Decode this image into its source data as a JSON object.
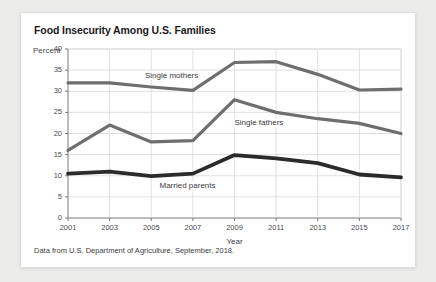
{
  "card": {
    "title": "Food Insecurity Among U.S. Families",
    "caption": "Data from U.S. Department of Agriculture, September, 2018."
  },
  "colors": {
    "background": "#ececeb",
    "card": "#ffffff",
    "grid": "#d8d8d8",
    "axis": "#7a7a7a",
    "series_single_mothers": "#6e6e6e",
    "series_single_fathers": "#6e6e6e",
    "series_married_parents": "#2b2b2b",
    "text": "#1b1b1b"
  },
  "chart_data": {
    "type": "line",
    "title": "Food Insecurity Among U.S. Families",
    "xlabel": "Year",
    "ylabel": "Percent",
    "x": [
      2001,
      2003,
      2005,
      2007,
      2009,
      2011,
      2013,
      2015,
      2017
    ],
    "xticklabels": [
      "2001",
      "2003",
      "2005",
      "2007",
      "2009",
      "2011",
      "2013",
      "2015",
      "2017"
    ],
    "yticklabels": [
      "0",
      "5",
      "10",
      "15",
      "20",
      "25",
      "30",
      "35",
      "40"
    ],
    "yticks": [
      0,
      5,
      10,
      15,
      20,
      25,
      30,
      35,
      40
    ],
    "xlim": [
      2001,
      2017
    ],
    "ylim": [
      0,
      40
    ],
    "grid": true,
    "legend": "inline-labels",
    "series": [
      {
        "name": "Single mothers",
        "color": "#6e6e6e",
        "width": 3.2,
        "label_x": 2004.6,
        "label_y": 33.6,
        "values": [
          32.0,
          32.0,
          31.0,
          30.2,
          36.8,
          37.0,
          34.0,
          30.3,
          30.5
        ]
      },
      {
        "name": "Single fathers",
        "color": "#6e6e6e",
        "width": 3.2,
        "label_x": 2008.9,
        "label_y": 22.6,
        "values": [
          16.0,
          22.0,
          18.0,
          18.3,
          28.0,
          25.0,
          23.5,
          22.4,
          20.0
        ]
      },
      {
        "name": "Married parents",
        "color": "#2b2b2b",
        "width": 3.8,
        "label_x": 2005.3,
        "label_y": 7.6,
        "values": [
          10.5,
          11.0,
          9.9,
          10.5,
          14.9,
          14.1,
          13.0,
          10.3,
          9.6
        ]
      }
    ]
  }
}
